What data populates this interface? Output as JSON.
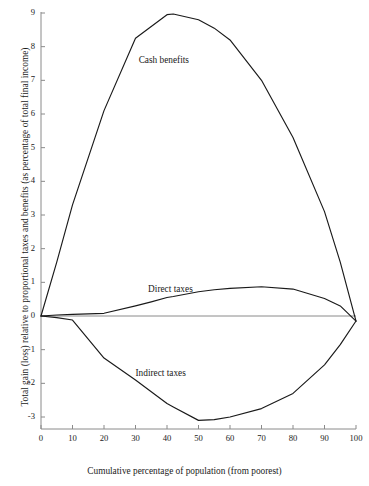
{
  "chart_data": {
    "type": "line",
    "title": "",
    "subtitle": "",
    "xlabel": "Cumulative percentage of population (from poorest)",
    "ylabel": "Total gain (loss) relative to proportional taxes and benefits (as percentage of total final income)",
    "xlim": [
      0,
      100
    ],
    "ylim": [
      -3.5,
      9.2
    ],
    "xticks": [
      0,
      10,
      20,
      30,
      40,
      50,
      60,
      70,
      80,
      90,
      100
    ],
    "xticklabels": [
      "0",
      "10",
      "20",
      "30",
      "40",
      "50",
      "60",
      "70",
      "80",
      "90",
      "100"
    ],
    "yticks": [
      -3,
      -2,
      -1,
      0,
      1,
      2,
      3,
      4,
      5,
      6,
      7,
      8,
      9
    ],
    "yticklabels": [
      "-3",
      "-2",
      "-1",
      "0",
      "1",
      "2",
      "3",
      "4",
      "5",
      "6",
      "7",
      "8",
      "9"
    ],
    "grid": false,
    "legend_position": "inline-annotations",
    "line_color": "#1a1a1a",
    "axis_color": "#8a8a8a",
    "zero_line": true,
    "x": [
      0,
      5,
      10,
      20,
      30,
      35,
      40,
      42,
      50,
      55,
      60,
      70,
      80,
      90,
      95,
      100
    ],
    "series": [
      {
        "name": "Cash benefits",
        "label": "Cash benefits",
        "label_x": 31,
        "label_y": 7.55,
        "values": [
          0.0,
          1.6,
          3.3,
          6.1,
          8.25,
          8.6,
          8.95,
          8.97,
          8.8,
          8.55,
          8.2,
          7.0,
          5.3,
          3.1,
          1.6,
          -0.15
        ]
      },
      {
        "name": "Direct taxes",
        "label": "Direct taxes",
        "label_x": 34,
        "label_y": 0.75,
        "values": [
          0.0,
          0.03,
          0.05,
          0.08,
          0.3,
          0.42,
          0.55,
          0.58,
          0.72,
          0.78,
          0.82,
          0.87,
          0.8,
          0.52,
          0.3,
          -0.15
        ]
      },
      {
        "name": "Indirect taxes",
        "label": "Indirect taxes",
        "label_x": 30,
        "label_y": -1.75,
        "values": [
          0.0,
          -0.05,
          -0.12,
          -1.25,
          -1.9,
          -2.25,
          -2.6,
          -2.7,
          -3.1,
          -3.08,
          -3.0,
          -2.75,
          -2.3,
          -1.45,
          -0.85,
          -0.15
        ]
      }
    ]
  }
}
